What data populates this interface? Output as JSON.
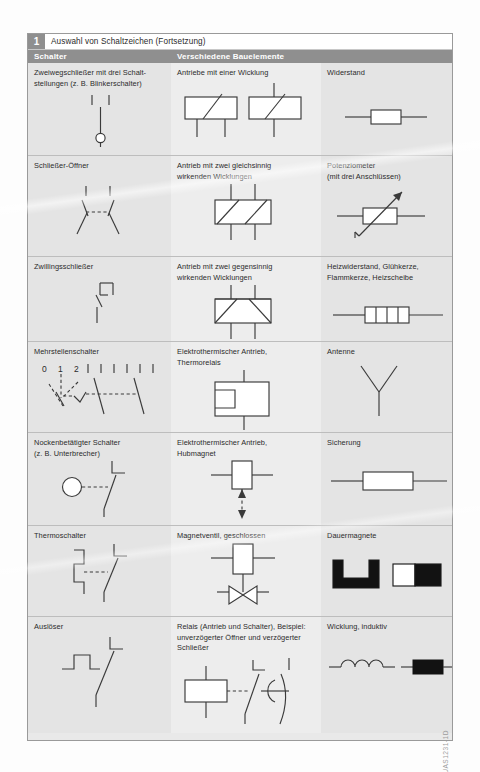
{
  "figure": {
    "number": "1",
    "title": "Auswahl von Schaltzeichen (Fortsetzung)",
    "side_code": "UAS1231-1D"
  },
  "column_headers": {
    "col1": "Schalter",
    "col2": "Verschiedene Bauelemente",
    "col3": ""
  },
  "rows": [
    {
      "col1_label": "Zweiwegschließer mit drei Schalt-\nstellungen (z. B. Blinkerschalter)",
      "col1_symbol": "two-way-switch-three-positions",
      "col2_label": "Antriebe mit einer Wicklung",
      "col2_symbol": "actuator-single-winding-pair",
      "col3_label": "Widerstand",
      "col3_symbol": "resistor"
    },
    {
      "col1_label": "Schließer-Öffner",
      "col1_symbol": "changeover-contact",
      "col2_label": "Antrieb mit zwei gleichsinnig\nwirkenden Wicklungen",
      "col2_symbol": "actuator-two-windings-same-direction",
      "col3_label": "Potenziometer\n(mit drei Anschlüssen)",
      "col3_symbol": "potentiometer"
    },
    {
      "col1_label": "Zwillingsschließer",
      "col1_symbol": "twin-make-contact",
      "col2_label": "Antrieb mit zwei gegensinnig\nwirkenden Wicklungen",
      "col2_symbol": "actuator-two-windings-opposed",
      "col3_label": "Heizwiderstand, Glühkerze,\nFlammkerze, Heizscheibe",
      "col3_symbol": "heating-resistor"
    },
    {
      "col1_label": "Mehrstellenschalter",
      "col1_symbol": "multi-position-switch",
      "col1_symbol_numbers": [
        "0",
        "1",
        "2"
      ],
      "col2_label": "Elektrothermischer Antrieb,\nThermorelais",
      "col2_symbol": "electrothermal-actuator-thermal-relay",
      "col3_label": "Antenne",
      "col3_symbol": "antenna"
    },
    {
      "col1_label": "Nockenbetätigter Schalter\n(z. B. Unterbrecher)",
      "col1_symbol": "cam-operated-switch",
      "col2_label": "Elektrothermischer Antrieb,\nHubmagnet",
      "col2_symbol": "electrothermal-actuator-solenoid",
      "col3_label": "Sicherung",
      "col3_symbol": "fuse"
    },
    {
      "col1_label": "Thermoschalter",
      "col1_symbol": "thermal-switch",
      "col2_label": "Magnetventil, geschlossen",
      "col2_symbol": "solenoid-valve-closed",
      "col3_label": "Dauermagnete",
      "col3_symbol": "permanent-magnets"
    },
    {
      "col1_label": "Auslöser",
      "col1_symbol": "tripping-device",
      "col2_label": "Relais (Antrieb und Schalter), Beispiel:\nunverzögerter Öffner und verzögerter\nSchließer",
      "col2_symbol": "relay-with-contacts",
      "col3_label": "Wicklung, induktiv",
      "col3_symbol": "inductive-winding"
    }
  ],
  "colors": {
    "header_gray": "#8f8f8f",
    "cell_gray": "#e4e4e4",
    "cell_gray_alt": "#ededed",
    "line": "#3a3a3a",
    "black_fill": "#121212"
  }
}
